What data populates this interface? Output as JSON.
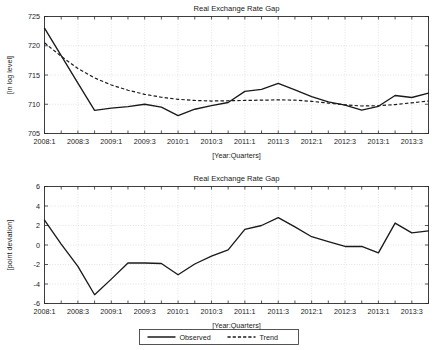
{
  "figure": {
    "width": 438,
    "height": 350,
    "background": "#ffffff",
    "line_color": "#1a1a1a",
    "grid_color": "#c8c8c8"
  },
  "legend": {
    "position": "bottom-center",
    "entries": [
      {
        "label": "Observed",
        "style": "solid"
      },
      {
        "label": "Trend",
        "style": "dashed"
      }
    ]
  },
  "chart_data": [
    {
      "type": "line",
      "title": "Real Exchange Rate Gap",
      "xlabel": "[Year:Quarters]",
      "ylabel": "[in log level]",
      "ylim": [
        705,
        725
      ],
      "yticks": [
        705,
        710,
        715,
        720,
        725
      ],
      "xlim": [
        0,
        23
      ],
      "grid": true,
      "x": [
        "2008:1",
        "2008:2",
        "2008:3",
        "2008:4",
        "2009:1",
        "2009:2",
        "2009:3",
        "2009:4",
        "2010:1",
        "2010:2",
        "2010:3",
        "2010:4",
        "2011:1",
        "2011:2",
        "2011:3",
        "2011:4",
        "2012:1",
        "2012:2",
        "2012:3",
        "2012:4",
        "2013:1",
        "2013:2",
        "2013:3",
        "2013:4"
      ],
      "xtick_labels": [
        "2008:1",
        "2008:3",
        "2009:1",
        "2009:3",
        "2010:1",
        "2010:3",
        "2011:1",
        "2011:3",
        "2012:1",
        "2012:3",
        "2013:1",
        "2013:3"
      ],
      "xtick_indices": [
        0,
        2,
        4,
        6,
        8,
        10,
        12,
        14,
        16,
        18,
        20,
        22
      ],
      "series": [
        {
          "name": "Observed",
          "style": "solid",
          "values": [
            723.0,
            718.3,
            713.6,
            708.95,
            709.35,
            709.6,
            710.0,
            709.5,
            708.05,
            709.15,
            709.75,
            710.3,
            712.2,
            712.55,
            713.55,
            712.45,
            711.3,
            710.4,
            709.85,
            709.0,
            709.65,
            711.5,
            711.15,
            711.9,
            712.6,
            713.95
          ]
        },
        {
          "name": "Trend",
          "style": "dashed",
          "values": [
            720.5,
            718.2,
            716.1,
            714.5,
            713.3,
            712.4,
            711.7,
            711.2,
            710.85,
            710.65,
            710.55,
            710.6,
            710.65,
            710.7,
            710.75,
            710.7,
            710.5,
            710.2,
            709.9,
            709.7,
            709.75,
            709.95,
            710.25,
            710.55,
            710.7,
            710.8
          ]
        }
      ]
    },
    {
      "type": "line",
      "title": "Real Exchange Rate Gap",
      "xlabel": "[Year:Quarters]",
      "ylabel": "[point deviation]",
      "ylim": [
        -6,
        6
      ],
      "yticks": [
        -6,
        -4,
        -2,
        0,
        2,
        4,
        6
      ],
      "xlim": [
        0,
        23
      ],
      "grid": true,
      "x": [
        "2008:1",
        "2008:2",
        "2008:3",
        "2008:4",
        "2009:1",
        "2009:2",
        "2009:3",
        "2009:4",
        "2010:1",
        "2010:2",
        "2010:3",
        "2010:4",
        "2011:1",
        "2011:2",
        "2011:3",
        "2011:4",
        "2012:1",
        "2012:2",
        "2012:3",
        "2012:4",
        "2013:1",
        "2013:2",
        "2013:3",
        "2013:4"
      ],
      "xtick_labels": [
        "2008:1",
        "2008:3",
        "2009:1",
        "2009:3",
        "2010:1",
        "2010:3",
        "2011:1",
        "2011:3",
        "2012:1",
        "2012:3",
        "2013:1",
        "2013:3"
      ],
      "xtick_indices": [
        0,
        2,
        4,
        6,
        8,
        10,
        12,
        14,
        16,
        18,
        20,
        22
      ],
      "series": [
        {
          "name": "Observed",
          "style": "solid",
          "values": [
            2.55,
            0.1,
            -2.2,
            -5.1,
            -3.5,
            -1.85,
            -1.85,
            -1.9,
            -3.05,
            -1.95,
            -1.15,
            -0.5,
            1.6,
            2.0,
            2.8,
            1.85,
            0.85,
            0.35,
            -0.15,
            -0.15,
            -0.8,
            2.25,
            1.25,
            1.45,
            1.65,
            3.1
          ]
        }
      ]
    }
  ]
}
